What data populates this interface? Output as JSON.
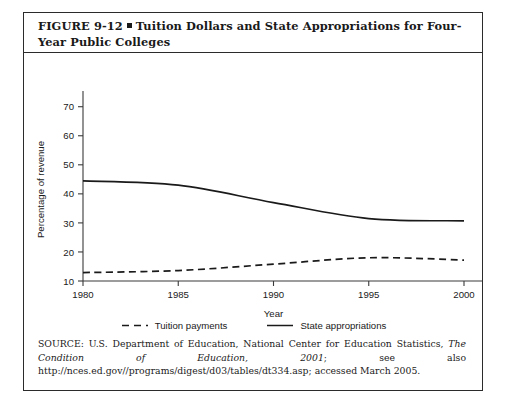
{
  "figure": {
    "label": "FIGURE 9-12",
    "bullet": "square-bullet",
    "title": "Tuition Dollars and State Appropriations for Four-Year Public Colleges"
  },
  "source": {
    "prefix": "SOURCE: U.S. Department of Education, National Center for Education Statistics, ",
    "italic_title": "The Condition of Education, 2001",
    "middle": "; see also ",
    "url": "http://nces.ed.gov//programs/digest/d03/tables/dt334.asp",
    "suffix": "; accessed March 2005."
  },
  "legend": {
    "items": [
      {
        "label": "Tuition payments",
        "style": "dashed",
        "color": "#1a1a1a"
      },
      {
        "label": "State appropriations",
        "style": "solid",
        "color": "#1a1a1a"
      }
    ]
  },
  "chart_data": {
    "type": "line",
    "title": "Tuition Dollars and State Appropriations for Four-Year Public Colleges",
    "xlabel": "Year",
    "ylabel": "Percentage of revenue",
    "xlim": [
      1980,
      2000
    ],
    "ylim": [
      10,
      73
    ],
    "xticks": [
      1980,
      1985,
      1990,
      1995,
      2000
    ],
    "yticks": [
      10,
      20,
      30,
      40,
      50,
      60,
      70
    ],
    "grid": false,
    "legend_position": "bottom",
    "series": [
      {
        "name": "State appropriations",
        "style": "solid",
        "color": "#1a1a1a",
        "x": [
          1980,
          1985,
          1990,
          1995,
          2000
        ],
        "values": [
          44.5,
          43.0,
          37.0,
          31.5,
          30.7
        ]
      },
      {
        "name": "Tuition payments",
        "style": "dashed",
        "color": "#1a1a1a",
        "x": [
          1980,
          1985,
          1990,
          1995,
          2000
        ],
        "values": [
          12.9,
          13.6,
          15.8,
          18.0,
          17.2
        ]
      }
    ]
  }
}
